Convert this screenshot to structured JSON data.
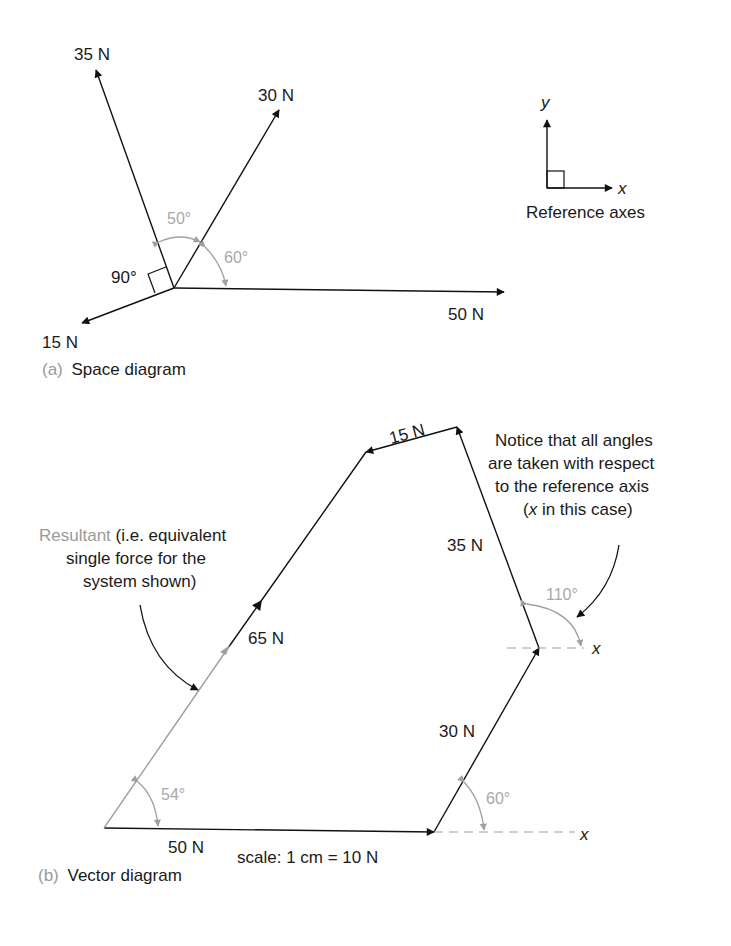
{
  "space_diagram": {
    "caption_letter": "(a)",
    "caption_text": "Space diagram",
    "forces": [
      {
        "label": "35 N",
        "direction_deg": 110
      },
      {
        "label": "30 N",
        "direction_deg": 60
      },
      {
        "label": "50 N",
        "direction_deg": 0
      },
      {
        "label": "15 N",
        "direction_deg": 200
      }
    ],
    "angles": {
      "a1": "50°",
      "a2": "60°",
      "a3": "90°"
    },
    "reference_axes": {
      "y": "y",
      "x": "x",
      "caption": "Reference axes"
    }
  },
  "vector_diagram": {
    "caption_letter": "(b)",
    "caption_text": "Vector diagram",
    "sides": {
      "s50": "50 N",
      "s30": "30 N",
      "s35": "35 N",
      "s15": "15 N",
      "s65": "65 N"
    },
    "angles": {
      "a54": "54°",
      "a60": "60°",
      "a110": "110°"
    },
    "axis_x1": "x",
    "axis_x2": "x",
    "scale": "scale: 1 cm = 10 N",
    "note_resultant_grey": "Resultant",
    "note_resultant_l1": " (i.e. equivalent",
    "note_resultant_l2": "single force for the",
    "note_resultant_l3": "system shown)",
    "note_axis_l1": "Notice that all angles",
    "note_axis_l2": "are taken with respect",
    "note_axis_l3": "to the reference axis",
    "note_axis_l4_open": "(",
    "note_axis_l4_x": "x",
    "note_axis_l4_rest": " in this case)"
  }
}
